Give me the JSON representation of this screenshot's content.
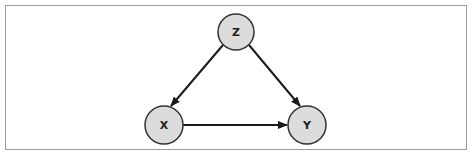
{
  "diagram": {
    "type": "causal-dag",
    "nodes": [
      {
        "id": "Z",
        "label": "Z",
        "cx": 236,
        "cy": 32,
        "r": 18
      },
      {
        "id": "X",
        "label": "X",
        "cx": 164,
        "cy": 125,
        "r": 19
      },
      {
        "id": "Y",
        "label": "Y",
        "cx": 307,
        "cy": 125,
        "r": 19
      }
    ],
    "edges": [
      {
        "from": "Z",
        "to": "X"
      },
      {
        "from": "Z",
        "to": "Y"
      },
      {
        "from": "X",
        "to": "Y"
      }
    ],
    "colors": {
      "node_fill": "#dcdcdc",
      "node_stroke": "#333333",
      "edge": "#1a1a1a",
      "frame": "#9a9a9a"
    }
  }
}
